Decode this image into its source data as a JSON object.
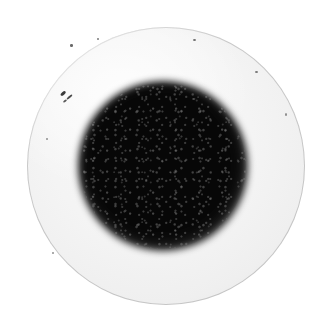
{
  "image": {
    "kind": "photograph",
    "subject": "petri-dish-bacterial-colony",
    "caption": "Grayscale photograph of a Petri dish containing a single large dark circular bacterial colony on pale agar",
    "width": 329,
    "height": 330,
    "color_mode": "grayscale",
    "background_color": "#ffffff"
  },
  "dish": {
    "label": "Petri dish",
    "center_x": 166,
    "center_y": 166,
    "radius": 139,
    "rim_color": "#1a1a1a",
    "agar_color": "#f2f2f2",
    "inner_wall_label": "Inner dish wall",
    "inner_wall_color": "#5a5a5a",
    "sheen_label": "Specular sheen"
  },
  "colony": {
    "label": "Bacterial colony",
    "center_x": 163,
    "center_y": 166,
    "core_radius": 62,
    "halo_radius": 85,
    "core_color": "#080808",
    "halo_color": "#787878",
    "texture": "grainy mottled with light speckles",
    "edge": "soft blurred gradient"
  },
  "artifacts": {
    "label": "Surface specks and debris",
    "specks": [
      {
        "name": "speck-a",
        "x": 60,
        "y": 92,
        "color": "#3a3a3a"
      },
      {
        "name": "speck-b",
        "x": 66,
        "y": 96,
        "color": "#4a4a4a"
      },
      {
        "name": "speck-c",
        "x": 63,
        "y": 100,
        "color": "#585858"
      },
      {
        "name": "speck-d",
        "x": 70,
        "y": 44,
        "color": "#6a6a6a"
      },
      {
        "name": "speck-e",
        "x": 97,
        "y": 38,
        "color": "#7a7a7a"
      },
      {
        "name": "speck-f",
        "x": 193,
        "y": 39,
        "color": "#6e6e6e"
      },
      {
        "name": "speck-g",
        "x": 255,
        "y": 71,
        "color": "#7b7b7b"
      },
      {
        "name": "speck-h",
        "x": 285,
        "y": 113,
        "color": "#8a8a8a"
      },
      {
        "name": "speck-i",
        "x": 46,
        "y": 138,
        "color": "#8e8e8e"
      },
      {
        "name": "speck-j",
        "x": 52,
        "y": 252,
        "color": "#909090"
      }
    ]
  }
}
